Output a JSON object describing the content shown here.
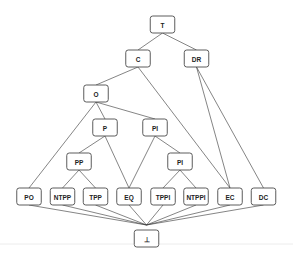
{
  "diagram": {
    "type": "lattice",
    "nodes": [
      {
        "id": "top",
        "label": "T"
      },
      {
        "id": "C",
        "label": "C"
      },
      {
        "id": "DR",
        "label": "DR"
      },
      {
        "id": "O",
        "label": "O"
      },
      {
        "id": "P",
        "label": "P"
      },
      {
        "id": "PI_upper",
        "label": "PI"
      },
      {
        "id": "PP",
        "label": "PP"
      },
      {
        "id": "PI_lower",
        "label": "PI"
      },
      {
        "id": "PO",
        "label": "PO"
      },
      {
        "id": "NTPP",
        "label": "NTPP"
      },
      {
        "id": "TPP",
        "label": "TPP"
      },
      {
        "id": "EQ",
        "label": "EQ"
      },
      {
        "id": "TPPI",
        "label": "TPPI"
      },
      {
        "id": "NTPPI",
        "label": "NTPPI"
      },
      {
        "id": "EC",
        "label": "EC"
      },
      {
        "id": "DC",
        "label": "DC"
      },
      {
        "id": "bottom",
        "label": "⊥"
      }
    ],
    "edges": [
      [
        "top",
        "C"
      ],
      [
        "top",
        "DR"
      ],
      [
        "C",
        "O"
      ],
      [
        "C",
        "EC"
      ],
      [
        "DR",
        "EC"
      ],
      [
        "DR",
        "DC"
      ],
      [
        "O",
        "PO"
      ],
      [
        "O",
        "P"
      ],
      [
        "O",
        "PI_upper"
      ],
      [
        "P",
        "PP"
      ],
      [
        "P",
        "EQ"
      ],
      [
        "PI_upper",
        "EQ"
      ],
      [
        "PI_upper",
        "PI_lower"
      ],
      [
        "PP",
        "NTPP"
      ],
      [
        "PP",
        "TPP"
      ],
      [
        "PI_lower",
        "TPPI"
      ],
      [
        "PI_lower",
        "NTPPI"
      ],
      [
        "PO",
        "bottom"
      ],
      [
        "NTPP",
        "bottom"
      ],
      [
        "TPP",
        "bottom"
      ],
      [
        "EQ",
        "bottom"
      ],
      [
        "TPPI",
        "bottom"
      ],
      [
        "NTPPI",
        "bottom"
      ],
      [
        "EC",
        "bottom"
      ],
      [
        "DC",
        "bottom"
      ]
    ]
  }
}
